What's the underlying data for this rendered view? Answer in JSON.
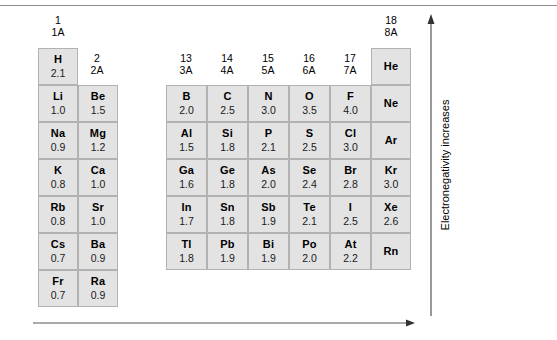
{
  "figure": {
    "top_rule": true,
    "cell_fill": "#e3e3e3",
    "cell_border": "#b2b2b2",
    "arrow_color": "#555555"
  },
  "group_headers": [
    {
      "number": "1",
      "alt": "1A",
      "x": 38,
      "y": 14
    },
    {
      "number": "2",
      "alt": "2A",
      "x": 77,
      "y": 52
    },
    {
      "number": "13",
      "alt": "3A",
      "x": 166,
      "y": 52
    },
    {
      "number": "14",
      "alt": "4A",
      "x": 207,
      "y": 52
    },
    {
      "number": "15",
      "alt": "5A",
      "x": 248,
      "y": 52
    },
    {
      "number": "16",
      "alt": "6A",
      "x": 289,
      "y": 52
    },
    {
      "number": "17",
      "alt": "7A",
      "x": 330,
      "y": 52
    },
    {
      "number": "18",
      "alt": "8A",
      "x": 371,
      "y": 14
    }
  ],
  "cells": [
    {
      "symbol": "H",
      "value": "2.1",
      "x": 38,
      "y": 48,
      "w": 40,
      "h": 37
    },
    {
      "symbol": "He",
      "value": "",
      "x": 371,
      "y": 48,
      "w": 40,
      "h": 37
    },
    {
      "symbol": "Li",
      "value": "1.0",
      "x": 38,
      "y": 85,
      "w": 40,
      "h": 37
    },
    {
      "symbol": "Be",
      "value": "1.5",
      "x": 78,
      "y": 85,
      "w": 40,
      "h": 37
    },
    {
      "symbol": "B",
      "value": "2.0",
      "x": 166,
      "y": 85,
      "w": 41,
      "h": 37
    },
    {
      "symbol": "C",
      "value": "2.5",
      "x": 207,
      "y": 85,
      "w": 41,
      "h": 37
    },
    {
      "symbol": "N",
      "value": "3.0",
      "x": 248,
      "y": 85,
      "w": 41,
      "h": 37
    },
    {
      "symbol": "O",
      "value": "3.5",
      "x": 289,
      "y": 85,
      "w": 41,
      "h": 37
    },
    {
      "symbol": "F",
      "value": "4.0",
      "x": 330,
      "y": 85,
      "w": 41,
      "h": 37
    },
    {
      "symbol": "Ne",
      "value": "",
      "x": 371,
      "y": 85,
      "w": 40,
      "h": 37
    },
    {
      "symbol": "Na",
      "value": "0.9",
      "x": 38,
      "y": 122,
      "w": 40,
      "h": 37
    },
    {
      "symbol": "Mg",
      "value": "1.2",
      "x": 78,
      "y": 122,
      "w": 40,
      "h": 37
    },
    {
      "symbol": "Al",
      "value": "1.5",
      "x": 166,
      "y": 122,
      "w": 41,
      "h": 37
    },
    {
      "symbol": "Si",
      "value": "1.8",
      "x": 207,
      "y": 122,
      "w": 41,
      "h": 37
    },
    {
      "symbol": "P",
      "value": "2.1",
      "x": 248,
      "y": 122,
      "w": 41,
      "h": 37
    },
    {
      "symbol": "S",
      "value": "2.5",
      "x": 289,
      "y": 122,
      "w": 41,
      "h": 37
    },
    {
      "symbol": "Cl",
      "value": "3.0",
      "x": 330,
      "y": 122,
      "w": 41,
      "h": 37
    },
    {
      "symbol": "Ar",
      "value": "",
      "x": 371,
      "y": 122,
      "w": 40,
      "h": 37
    },
    {
      "symbol": "K",
      "value": "0.8",
      "x": 38,
      "y": 159,
      "w": 40,
      "h": 37
    },
    {
      "symbol": "Ca",
      "value": "1.0",
      "x": 78,
      "y": 159,
      "w": 40,
      "h": 37
    },
    {
      "symbol": "Ga",
      "value": "1.6",
      "x": 166,
      "y": 159,
      "w": 41,
      "h": 37
    },
    {
      "symbol": "Ge",
      "value": "1.8",
      "x": 207,
      "y": 159,
      "w": 41,
      "h": 37
    },
    {
      "symbol": "As",
      "value": "2.0",
      "x": 248,
      "y": 159,
      "w": 41,
      "h": 37
    },
    {
      "symbol": "Se",
      "value": "2.4",
      "x": 289,
      "y": 159,
      "w": 41,
      "h": 37
    },
    {
      "symbol": "Br",
      "value": "2.8",
      "x": 330,
      "y": 159,
      "w": 41,
      "h": 37
    },
    {
      "symbol": "Kr",
      "value": "3.0",
      "x": 371,
      "y": 159,
      "w": 40,
      "h": 37
    },
    {
      "symbol": "Rb",
      "value": "0.8",
      "x": 38,
      "y": 196,
      "w": 40,
      "h": 37
    },
    {
      "symbol": "Sr",
      "value": "1.0",
      "x": 78,
      "y": 196,
      "w": 40,
      "h": 37
    },
    {
      "symbol": "In",
      "value": "1.7",
      "x": 166,
      "y": 196,
      "w": 41,
      "h": 37
    },
    {
      "symbol": "Sn",
      "value": "1.8",
      "x": 207,
      "y": 196,
      "w": 41,
      "h": 37
    },
    {
      "symbol": "Sb",
      "value": "1.9",
      "x": 248,
      "y": 196,
      "w": 41,
      "h": 37
    },
    {
      "symbol": "Te",
      "value": "2.1",
      "x": 289,
      "y": 196,
      "w": 41,
      "h": 37
    },
    {
      "symbol": "I",
      "value": "2.5",
      "x": 330,
      "y": 196,
      "w": 41,
      "h": 37
    },
    {
      "symbol": "Xe",
      "value": "2.6",
      "x": 371,
      "y": 196,
      "w": 40,
      "h": 37
    },
    {
      "symbol": "Cs",
      "value": "0.7",
      "x": 38,
      "y": 233,
      "w": 40,
      "h": 37
    },
    {
      "symbol": "Ba",
      "value": "0.9",
      "x": 78,
      "y": 233,
      "w": 40,
      "h": 37
    },
    {
      "symbol": "Tl",
      "value": "1.8",
      "x": 166,
      "y": 233,
      "w": 41,
      "h": 37
    },
    {
      "symbol": "Pb",
      "value": "1.9",
      "x": 207,
      "y": 233,
      "w": 41,
      "h": 37
    },
    {
      "symbol": "Bi",
      "value": "1.9",
      "x": 248,
      "y": 233,
      "w": 41,
      "h": 37
    },
    {
      "symbol": "Po",
      "value": "2.0",
      "x": 289,
      "y": 233,
      "w": 41,
      "h": 37
    },
    {
      "symbol": "At",
      "value": "2.2",
      "x": 330,
      "y": 233,
      "w": 41,
      "h": 37
    },
    {
      "symbol": "Rn",
      "value": "",
      "x": 371,
      "y": 233,
      "w": 40,
      "h": 37
    },
    {
      "symbol": "Fr",
      "value": "0.7",
      "x": 38,
      "y": 270,
      "w": 40,
      "h": 37
    },
    {
      "symbol": "Ra",
      "value": "0.9",
      "x": 78,
      "y": 270,
      "w": 40,
      "h": 37
    }
  ],
  "annotations": {
    "vertical_arrow_label": "Electronegativity increases",
    "horizontal_arrow_label": ""
  },
  "chart_data": {
    "type": "table",
    "columns": [
      "1 / 1A",
      "2 / 2A",
      "13 / 3A",
      "14 / 4A",
      "15 / 5A",
      "16 / 6A",
      "17 / 7A",
      "18 / 8A"
    ],
    "rows": [
      {
        "period": 1,
        "entries": [
          {
            "symbol": "H",
            "value": 2.1
          },
          null,
          null,
          null,
          null,
          null,
          null,
          {
            "symbol": "He",
            "value": null
          }
        ]
      },
      {
        "period": 2,
        "entries": [
          {
            "symbol": "Li",
            "value": 1.0
          },
          {
            "symbol": "Be",
            "value": 1.5
          },
          {
            "symbol": "B",
            "value": 2.0
          },
          {
            "symbol": "C",
            "value": 2.5
          },
          {
            "symbol": "N",
            "value": 3.0
          },
          {
            "symbol": "O",
            "value": 3.5
          },
          {
            "symbol": "F",
            "value": 4.0
          },
          {
            "symbol": "Ne",
            "value": null
          }
        ]
      },
      {
        "period": 3,
        "entries": [
          {
            "symbol": "Na",
            "value": 0.9
          },
          {
            "symbol": "Mg",
            "value": 1.2
          },
          {
            "symbol": "Al",
            "value": 1.5
          },
          {
            "symbol": "Si",
            "value": 1.8
          },
          {
            "symbol": "P",
            "value": 2.1
          },
          {
            "symbol": "S",
            "value": 2.5
          },
          {
            "symbol": "Cl",
            "value": 3.0
          },
          {
            "symbol": "Ar",
            "value": null
          }
        ]
      },
      {
        "period": 4,
        "entries": [
          {
            "symbol": "K",
            "value": 0.8
          },
          {
            "symbol": "Ca",
            "value": 1.0
          },
          {
            "symbol": "Ga",
            "value": 1.6
          },
          {
            "symbol": "Ge",
            "value": 1.8
          },
          {
            "symbol": "As",
            "value": 2.0
          },
          {
            "symbol": "Se",
            "value": 2.4
          },
          {
            "symbol": "Br",
            "value": 2.8
          },
          {
            "symbol": "Kr",
            "value": 3.0
          }
        ]
      },
      {
        "period": 5,
        "entries": [
          {
            "symbol": "Rb",
            "value": 0.8
          },
          {
            "symbol": "Sr",
            "value": 1.0
          },
          {
            "symbol": "In",
            "value": 1.7
          },
          {
            "symbol": "Sn",
            "value": 1.8
          },
          {
            "symbol": "Sb",
            "value": 1.9
          },
          {
            "symbol": "Te",
            "value": 2.1
          },
          {
            "symbol": "I",
            "value": 2.5
          },
          {
            "symbol": "Xe",
            "value": 2.6
          }
        ]
      },
      {
        "period": 6,
        "entries": [
          {
            "symbol": "Cs",
            "value": 0.7
          },
          {
            "symbol": "Ba",
            "value": 0.9
          },
          {
            "symbol": "Tl",
            "value": 1.8
          },
          {
            "symbol": "Pb",
            "value": 1.9
          },
          {
            "symbol": "Bi",
            "value": 1.9
          },
          {
            "symbol": "Po",
            "value": 2.0
          },
          {
            "symbol": "At",
            "value": 2.2
          },
          {
            "symbol": "Rn",
            "value": null
          }
        ]
      },
      {
        "period": 7,
        "entries": [
          {
            "symbol": "Fr",
            "value": 0.7
          },
          {
            "symbol": "Ra",
            "value": 0.9
          },
          null,
          null,
          null,
          null,
          null,
          null
        ]
      }
    ],
    "axis_annotations": {
      "vertical": "Electronegativity increases",
      "vertical_direction": "up",
      "horizontal": "",
      "horizontal_direction": "right"
    },
    "value_range": [
      0.7,
      4.0
    ]
  }
}
